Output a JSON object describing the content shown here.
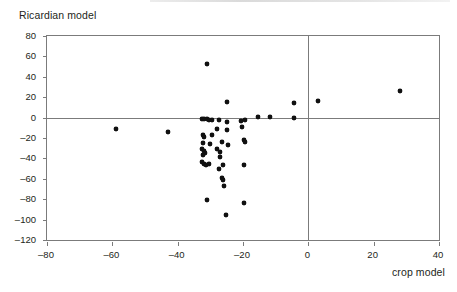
{
  "figure": {
    "y_axis_title": "Ricardian model",
    "x_axis_title": "crop model"
  },
  "chart_data": {
    "type": "scatter",
    "title": "",
    "xlabel": "crop model",
    "ylabel": "Ricardian model",
    "xlim": [
      -80,
      40
    ],
    "ylim": [
      -120,
      80
    ],
    "xticks": [
      -80,
      -60,
      -40,
      -20,
      0,
      20,
      40
    ],
    "yticks": [
      -120,
      -100,
      -80,
      -60,
      -40,
      -20,
      0,
      20,
      40,
      60,
      80
    ],
    "xtick_labels": [
      "–80",
      "–60",
      "–40",
      "–20",
      "0",
      "20",
      "40"
    ],
    "ytick_labels": [
      "–120",
      "–100",
      "–80",
      "–60",
      "–40",
      "–20",
      "0",
      "20",
      "40",
      "60",
      "80"
    ],
    "grid": false,
    "legend": false,
    "reference_lines": [
      {
        "axis": "y",
        "value": 0
      },
      {
        "axis": "x",
        "value": 0
      }
    ],
    "marker": {
      "shape": "diamond",
      "color": "#111111",
      "size": 4
    },
    "points": [
      {
        "x": -59.0,
        "y": -11.5
      },
      {
        "x": -43.0,
        "y": -14.0
      },
      {
        "x": -31.0,
        "y": 53.0
      },
      {
        "x": -25.0,
        "y": 15.0
      },
      {
        "x": -4.5,
        "y": 14.5
      },
      {
        "x": 3.0,
        "y": 16.5
      },
      {
        "x": 28.0,
        "y": 26.0
      },
      {
        "x": -32.5,
        "y": -1.0
      },
      {
        "x": -31.8,
        "y": -1.5
      },
      {
        "x": -31.0,
        "y": -1.0
      },
      {
        "x": -30.3,
        "y": -2.5
      },
      {
        "x": -29.5,
        "y": -2.0
      },
      {
        "x": -27.5,
        "y": -2.5
      },
      {
        "x": -25.0,
        "y": -4.5
      },
      {
        "x": -20.5,
        "y": -3.0
      },
      {
        "x": -19.5,
        "y": -2.5
      },
      {
        "x": -15.5,
        "y": 1.0
      },
      {
        "x": -11.8,
        "y": 0.5
      },
      {
        "x": -4.3,
        "y": -0.5
      },
      {
        "x": -28.0,
        "y": -11.0
      },
      {
        "x": -25.0,
        "y": -12.5
      },
      {
        "x": -20.2,
        "y": -9.5
      },
      {
        "x": -32.3,
        "y": -17.5
      },
      {
        "x": -32.0,
        "y": -19.5
      },
      {
        "x": -29.5,
        "y": -17.0
      },
      {
        "x": -19.8,
        "y": -22.0
      },
      {
        "x": -19.5,
        "y": -24.0
      },
      {
        "x": -32.2,
        "y": -25.0
      },
      {
        "x": -30.2,
        "y": -25.5
      },
      {
        "x": -26.5,
        "y": -24.0
      },
      {
        "x": -24.5,
        "y": -26.5
      },
      {
        "x": -32.5,
        "y": -30.5
      },
      {
        "x": -32.0,
        "y": -32.5
      },
      {
        "x": -31.5,
        "y": -34.5
      },
      {
        "x": -28.0,
        "y": -31.0
      },
      {
        "x": -27.0,
        "y": -33.5
      },
      {
        "x": -32.3,
        "y": -37.0
      },
      {
        "x": -27.0,
        "y": -38.5
      },
      {
        "x": -32.5,
        "y": -44.0
      },
      {
        "x": -32.0,
        "y": -45.5
      },
      {
        "x": -31.3,
        "y": -46.5
      },
      {
        "x": -30.5,
        "y": -45.0
      },
      {
        "x": -26.0,
        "y": -46.5
      },
      {
        "x": -19.8,
        "y": -46.5
      },
      {
        "x": -27.5,
        "y": -50.5
      },
      {
        "x": -26.3,
        "y": -59.0
      },
      {
        "x": -26.0,
        "y": -61.0
      },
      {
        "x": -25.8,
        "y": -67.0
      },
      {
        "x": -31.0,
        "y": -81.0
      },
      {
        "x": -19.8,
        "y": -83.5
      },
      {
        "x": -25.3,
        "y": -95.5
      }
    ]
  }
}
